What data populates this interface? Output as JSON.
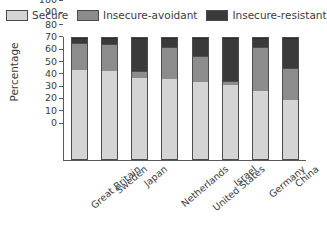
{
  "legend": {
    "position": "top",
    "items": [
      {
        "label": "Secure",
        "color": "#d4d4d4",
        "swatch_icon": "legend-swatch-icon"
      },
      {
        "label": "Insecure-avoidant",
        "color": "#8c8c8c",
        "swatch_icon": "legend-swatch-icon"
      },
      {
        "label": "Insecure-resistant",
        "color": "#3a3a3a",
        "swatch_icon": "legend-swatch-icon"
      }
    ]
  },
  "axes": {
    "ylabel": "Percentage",
    "yticks": [
      "100",
      "90",
      "80",
      "70",
      "60",
      "50",
      "40",
      "30",
      "20",
      "10",
      "0"
    ],
    "xlabel": ""
  },
  "chart_data": {
    "type": "bar",
    "title": "",
    "xlabel": "",
    "ylabel": "Percentage",
    "ylim": [
      0,
      100
    ],
    "yticks": [
      0,
      10,
      20,
      30,
      40,
      50,
      60,
      70,
      80,
      90,
      100
    ],
    "grid": false,
    "stacked": true,
    "legend_position": "top",
    "categories": [
      "Great Britain",
      "Sweden",
      "Japan",
      "Netherlands",
      "United States",
      "Israel",
      "Germany",
      "China"
    ],
    "series": [
      {
        "name": "Secure",
        "color": "#d4d4d4",
        "values": [
          75,
          74,
          68,
          67,
          65,
          62,
          57,
          50
        ]
      },
      {
        "name": "Insecure-avoidant",
        "color": "#8c8c8c",
        "values": [
          22,
          22,
          5,
          26,
          21,
          3,
          36,
          26
        ]
      },
      {
        "name": "Insecure-resistant",
        "color": "#3a3a3a",
        "values": [
          3,
          4,
          27,
          7,
          14,
          35,
          7,
          24
        ]
      }
    ]
  }
}
